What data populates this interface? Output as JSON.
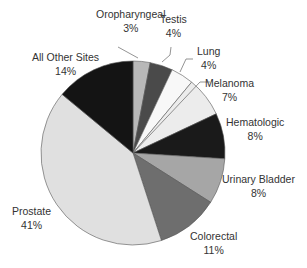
{
  "chart_data": {
    "type": "pie",
    "title": "",
    "start_angle_deg": 0,
    "direction": "clockwise",
    "center": [
      133,
      153
    ],
    "radius": 92,
    "slices": [
      {
        "label": "Oropharyngeal",
        "value": 3,
        "pct_label": "3%",
        "color": "#b8b8b8"
      },
      {
        "label": "Testis",
        "value": 4,
        "pct_label": "4%",
        "color": "#4a4a4a"
      },
      {
        "label": "Lung",
        "value": 4,
        "pct_label": "4%",
        "color": "#f8f8f8"
      },
      {
        "label": "Melanoma",
        "value": 7,
        "pct_label": "7%",
        "color": "#ececec"
      },
      {
        "label": "Hematologic",
        "value": 8,
        "pct_label": "8%",
        "color": "#1a1a1a"
      },
      {
        "label": "Urinary Bladder",
        "value": 8,
        "pct_label": "8%",
        "color": "#a6a6a6"
      },
      {
        "label": "Colorectal",
        "value": 11,
        "pct_label": "11%",
        "color": "#6e6e6e"
      },
      {
        "label": "Prostate",
        "value": 41,
        "pct_label": "41%",
        "color": "#e0e0e0"
      },
      {
        "label": "All Other Sites",
        "value": 14,
        "pct_label": "14%",
        "color": "#141414"
      }
    ]
  },
  "labels": [
    {
      "name": "Oropharyngeal",
      "pct": "3%",
      "x": 96,
      "y": 7
    },
    {
      "name": "Testis",
      "pct": "4%",
      "x": 160,
      "y": 12
    },
    {
      "name": "Lung",
      "pct": "4%",
      "x": 197,
      "y": 44
    },
    {
      "name": "Melanoma",
      "pct": "7%",
      "x": 205,
      "y": 76
    },
    {
      "name": "Hematologic",
      "pct": "8%",
      "x": 226,
      "y": 115
    },
    {
      "name": "Urinary Bladder",
      "pct": "8%",
      "x": 222,
      "y": 172
    },
    {
      "name": "Colorectal",
      "pct": "11%",
      "x": 190,
      "y": 229
    },
    {
      "name": "Prostate",
      "pct": "41%",
      "x": 12,
      "y": 204
    },
    {
      "name": "All Other Sites",
      "pct": "14%",
      "x": 32,
      "y": 50
    }
  ],
  "leaders": [
    {
      "points": [
        [
          118,
          47
        ],
        [
          138,
          58
        ]
      ]
    },
    {
      "points": [
        [
          171,
          47
        ],
        [
          170,
          55
        ],
        [
          162,
          62
        ]
      ]
    },
    {
      "points": [
        [
          193,
          59
        ],
        [
          186,
          59
        ],
        [
          180,
          72
        ]
      ]
    },
    {
      "points": [
        [
          210,
          82
        ],
        [
          200,
          82
        ],
        [
          133,
          153
        ]
      ]
    }
  ]
}
